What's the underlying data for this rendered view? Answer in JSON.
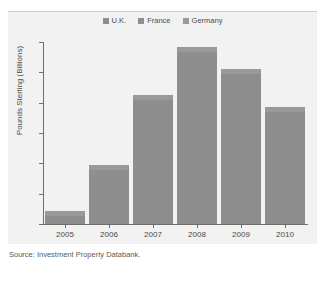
{
  "chart_data": {
    "type": "bar",
    "title": "",
    "subtitle": "",
    "xlabel": "",
    "ylabel": "Pounds Sterling (Billions)",
    "categories": [
      "2005",
      "2006",
      "2007",
      "2008",
      "2009",
      "2010"
    ],
    "series": [
      {
        "name": "U.K.",
        "color": "#8e8e8e",
        "values": [
          0.85,
          3.9,
          8.5,
          11.7,
          10.2,
          7.7
        ]
      }
    ],
    "legend_entries": [
      {
        "label": "U.K.",
        "color": "#8e8e8e"
      },
      {
        "label": "France",
        "color": "#8e8e8e"
      },
      {
        "label": "Germany",
        "color": "#9a9a9a"
      }
    ],
    "legend_position": "top-center",
    "ylim": [
      0,
      12
    ],
    "yticks": [
      "0",
      "2",
      "4",
      "6",
      "8",
      "10",
      "12"
    ],
    "ytick_values": [
      0,
      2,
      4,
      6,
      8,
      10,
      12
    ],
    "grid": false,
    "source": "Source: Investment Property Databank.",
    "colors": {
      "bar": "#8e8e8e",
      "bar_cap": "#9a9a9a",
      "panel_background": "#f2f2f2",
      "axis": "#6f6f6f",
      "text": "#4a4a4a",
      "rule": "#c9ccd1"
    }
  }
}
